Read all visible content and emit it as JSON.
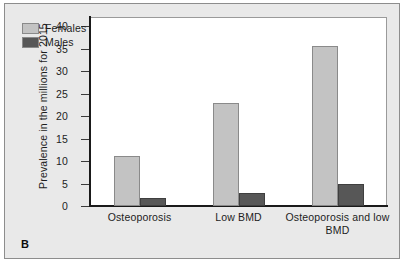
{
  "figure": {
    "panel_label": "B",
    "background_color": "#e9e9e9",
    "plot_background_color": "#ffffff"
  },
  "chart_data": {
    "type": "bar",
    "title": "",
    "xlabel": "",
    "ylabel": "Prevalence in the millions for 2015",
    "categories": [
      "Osteoporosis",
      "Low BMD",
      "Osteoporosis and low BMD"
    ],
    "series": [
      {
        "name": "Females",
        "color": "#c3c3c3",
        "values": [
          11.2,
          23.0,
          35.5
        ]
      },
      {
        "name": "Males",
        "color": "#575757",
        "values": [
          1.7,
          3.0,
          5.0
        ]
      }
    ],
    "ylim": [
      0,
      42
    ],
    "yticks": [
      0,
      5,
      10,
      15,
      20,
      25,
      30,
      35,
      40
    ],
    "ytick_labels": [
      "0",
      "5",
      "10",
      "15",
      "20",
      "25",
      "30",
      "35",
      "40"
    ],
    "grid": false,
    "legend_position": "top-left"
  }
}
